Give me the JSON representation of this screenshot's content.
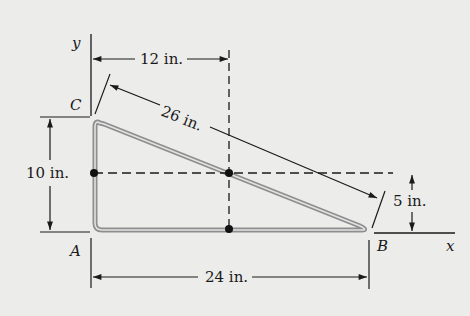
{
  "diagram": {
    "type": "bent-rod triangle with centroid construction",
    "labels": {
      "y_axis": "y",
      "x_axis": "x",
      "point_A": "A",
      "point_B": "B",
      "point_C": "C"
    },
    "dimensions": {
      "horizontal_to_centroid": "12 in.",
      "hypotenuse": "26 in.",
      "height": "10 in.",
      "centroid_height": "5 in.",
      "base": "24 in."
    },
    "colors": {
      "background": "#ececeb",
      "rod": "#9a9a9a",
      "rod_inner": "#e6e6e6",
      "ink": "#1a1a1a"
    }
  }
}
